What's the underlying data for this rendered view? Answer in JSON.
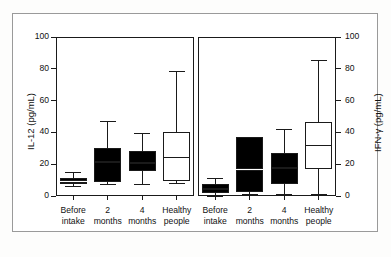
{
  "figure": {
    "background_color": "#ffffff",
    "frame_color": "#9a9a9a",
    "ink_color": "#1a1a1a",
    "fill_color": "#000000"
  },
  "chart_data": [
    {
      "type": "box",
      "panel": "left",
      "title": "",
      "xlabel": "",
      "ylabel": "IL-12 (pg/mL)",
      "ylim": [
        0,
        100
      ],
      "yticks": [
        0,
        20,
        40,
        60,
        80,
        100
      ],
      "ytick_labels": [
        "0",
        "20",
        "40",
        "60",
        "80",
        "100"
      ],
      "grid": false,
      "legend": "none",
      "categories": [
        "Before\nintake",
        "2\nmonths",
        "4\nmonths",
        "Healthy\npeople"
      ],
      "boxes": [
        {
          "label": "Before intake",
          "whisker_low": 6,
          "q1": 8,
          "median": 9.5,
          "q3": 11,
          "whisker_high": 15,
          "filled": true
        },
        {
          "label": "2 months",
          "whisker_low": 7,
          "q1": 9,
          "median": 22,
          "q3": 30,
          "whisker_high": 47,
          "filled": true
        },
        {
          "label": "4 months",
          "whisker_low": 7,
          "q1": 16,
          "median": 21,
          "q3": 28,
          "whisker_high": 39,
          "filled": true
        },
        {
          "label": "Healthy people",
          "whisker_low": 8,
          "q1": 10,
          "median": 24,
          "q3": 40,
          "whisker_high": 78,
          "filled": false
        }
      ]
    },
    {
      "type": "box",
      "panel": "right",
      "title": "",
      "xlabel": "",
      "ylabel": "IFN-γ (pg/mL)",
      "ylim": [
        0,
        100
      ],
      "yticks": [
        0,
        20,
        40,
        60,
        80,
        100
      ],
      "ytick_labels": [
        "0",
        "20",
        "40",
        "60",
        "80",
        "100"
      ],
      "grid": false,
      "legend": "none",
      "categories": [
        "Before\nintake",
        "2\nmonths",
        "4\nmonths",
        "Healthy\npeople"
      ],
      "boxes": [
        {
          "label": "Before intake",
          "whisker_low": 0,
          "q1": 2,
          "median": 5,
          "q3": 7,
          "whisker_high": 11,
          "filled": true
        },
        {
          "label": "2 months",
          "whisker_low": 1,
          "q1": 3,
          "median": 17,
          "q3": 37,
          "whisker_high": 37,
          "filled": true
        },
        {
          "label": "4 months",
          "whisker_low": 1,
          "q1": 8,
          "median": 18,
          "q3": 27,
          "whisker_high": 42,
          "filled": true
        },
        {
          "label": "Healthy people",
          "whisker_low": 1,
          "q1": 17,
          "median": 32,
          "q3": 46,
          "whisker_high": 85,
          "filled": false
        }
      ]
    }
  ]
}
